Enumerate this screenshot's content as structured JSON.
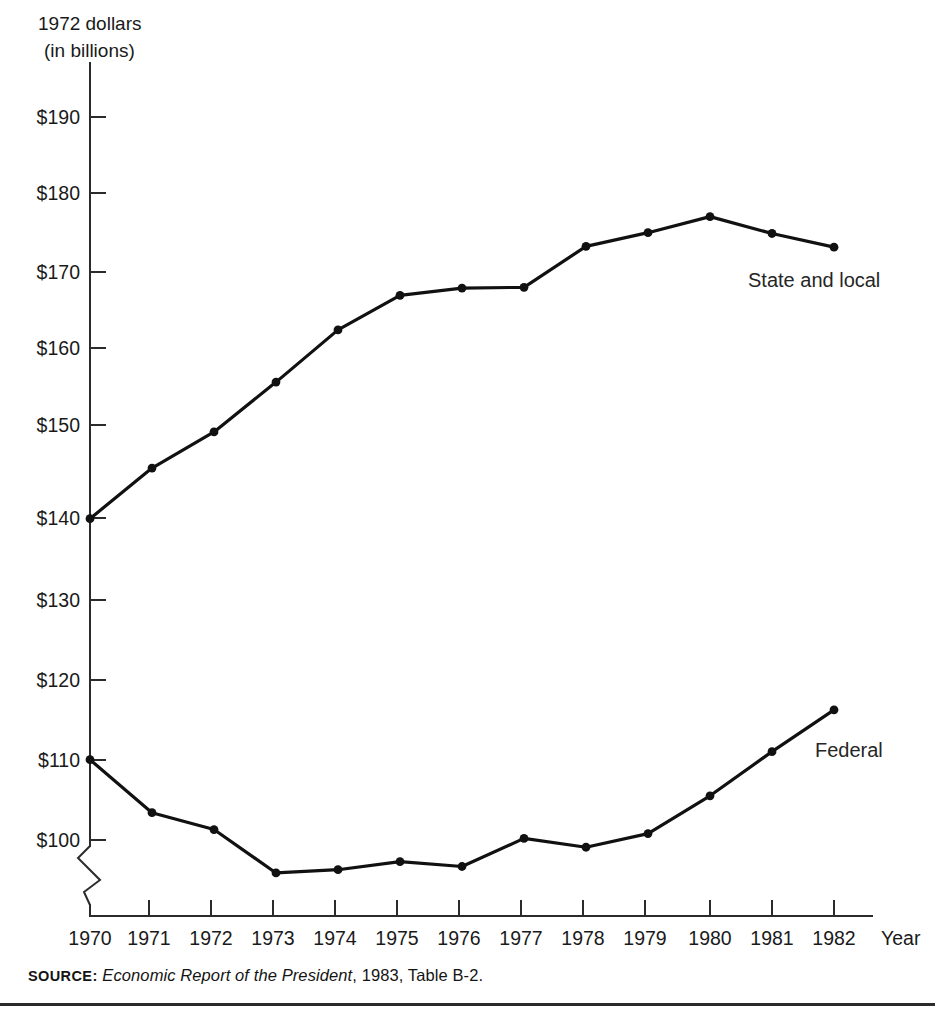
{
  "figure": {
    "y_axis_caption_line1": "1972 dollars",
    "y_axis_caption_line2": "(in billions)",
    "x_axis_title": "Year",
    "source_keyword": "SOURCE:",
    "source_title": "Economic Report of the President",
    "source_tail": ", 1983, Table B-2.",
    "axis_break_present": true,
    "line_color": "#111111",
    "axis_color": "#2b2b2b"
  },
  "chart_data": {
    "type": "line",
    "title": "",
    "subtitle": "",
    "xlabel": "Year",
    "ylabel": "1972 dollars (in billions)",
    "x": [
      1970,
      1971,
      1972,
      1973,
      1974,
      1975,
      1976,
      1977,
      1978,
      1979,
      1980,
      1981,
      1982
    ],
    "xtick_labels": [
      "1970",
      "1971",
      "1972",
      "1973",
      "1974",
      "1975",
      "1976",
      "1977",
      "1978",
      "1979",
      "1980",
      "1981",
      "1982"
    ],
    "ytick_labels": [
      "$100",
      "$110",
      "$120",
      "$130",
      "$140",
      "$150",
      "$160",
      "$170",
      "$180",
      "$190"
    ],
    "ytick_values": [
      100,
      110,
      120,
      130,
      140,
      150,
      160,
      170,
      180,
      190
    ],
    "ylim": [
      100,
      190
    ],
    "xlim": [
      1970,
      1982
    ],
    "grid": false,
    "legend": "inline-annotations",
    "axis_break_below": 100,
    "series": [
      {
        "name": "State and local",
        "label_position": "right-of-line",
        "values": [
          140.0,
          146.3,
          150.8,
          157.0,
          163.5,
          167.8,
          168.7,
          168.8,
          173.9,
          175.6,
          177.6,
          175.5,
          173.8
        ]
      },
      {
        "name": "Federal",
        "label_position": "right-of-line",
        "values": [
          110.0,
          103.4,
          101.3,
          95.9,
          96.3,
          97.3,
          96.7,
          100.2,
          99.1,
          100.8,
          105.5,
          111.0,
          116.2
        ]
      }
    ]
  }
}
